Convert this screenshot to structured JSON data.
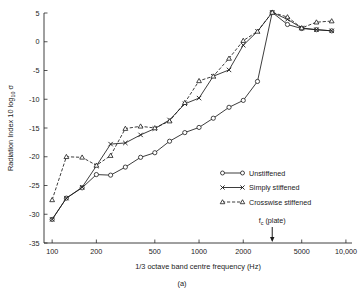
{
  "figure": {
    "caption": "(a)",
    "panel_label": "(a)"
  },
  "chart_data": {
    "type": "line",
    "title": "",
    "xlabel": "1/3 octave band centre frequency (Hz)",
    "ylabel": "Radiation Index 10 log₁₀ σ",
    "ylabel_parts": {
      "prefix": "Radiation Index 10 log",
      "subscript": "10",
      "symbol": "σ"
    },
    "xscale": "log",
    "xlim": [
      88,
      11000
    ],
    "ylim": [
      -35,
      5
    ],
    "grid": false,
    "legend_position": "lower-right",
    "xticks": [
      100,
      200,
      500,
      1000,
      2000,
      5000,
      10000
    ],
    "xticklabels": [
      "100",
      "200",
      "500",
      "1000",
      "2000",
      "5000",
      "10,000"
    ],
    "yticks": [
      5,
      0,
      -5,
      -10,
      -15,
      -20,
      -25,
      -30,
      -35
    ],
    "yticklabels": [
      "5",
      "0",
      "-5",
      "-10",
      "-15",
      "-20",
      "-25",
      "-30",
      "-35"
    ],
    "annotations": [
      {
        "name": "critical-frequency-marker",
        "label": "f",
        "label_sub": "c",
        "label_rest": " (plate)",
        "text": "fᴄ (plate)",
        "x": 3150,
        "y": -35,
        "arrow": "down"
      }
    ],
    "series": [
      {
        "name": "Unstiffened",
        "marker": "circle",
        "linestyle": "solid",
        "x": [
          100,
          125,
          160,
          200,
          250,
          315,
          400,
          500,
          630,
          800,
          1000,
          1250,
          1600,
          2000,
          2500,
          3150,
          4000,
          5000,
          6300,
          8000
        ],
        "y": [
          -30.9,
          -27.2,
          -25.4,
          -23.1,
          -23.2,
          -21.8,
          -20.1,
          -19.3,
          -17.3,
          -15.8,
          -14.9,
          -13.3,
          -11.4,
          -10.2,
          -6.9,
          5.1,
          3.0,
          2.3,
          2.1,
          1.9
        ]
      },
      {
        "name": "Simply stiffened",
        "marker": "x",
        "linestyle": "solid",
        "x": [
          100,
          125,
          160,
          200,
          250,
          315,
          400,
          500,
          630,
          800,
          1000,
          1250,
          1600,
          2000,
          2500,
          3150,
          4000,
          5000,
          6300,
          8000
        ],
        "y": [
          -30.9,
          -27.2,
          -25.3,
          -21.6,
          -17.8,
          -17.6,
          -16.2,
          -15.1,
          -13.6,
          -10.8,
          -9.8,
          -6.0,
          -4.9,
          -0.6,
          1.8,
          5.1,
          3.9,
          2.4,
          2.1,
          1.9
        ]
      },
      {
        "name": "Crosswise stiffened",
        "marker": "triangle",
        "linestyle": "dashed",
        "x": [
          100,
          125,
          160,
          200,
          250,
          315,
          400,
          500,
          630,
          800,
          1000,
          1250,
          1600,
          2000,
          2500,
          3150,
          4000,
          5000,
          6300,
          8000
        ],
        "y": [
          -27.5,
          -20.0,
          -20.1,
          -21.5,
          -19.8,
          -15.1,
          -14.7,
          -15.0,
          -13.8,
          -10.6,
          -6.8,
          -6.0,
          -2.9,
          0.2,
          1.8,
          5.1,
          4.3,
          2.4,
          3.4,
          3.6
        ]
      }
    ],
    "legend": [
      {
        "label": "Unstiffened",
        "marker": "circle",
        "linestyle": "solid"
      },
      {
        "label": "Simply stiffened",
        "marker": "x",
        "linestyle": "solid"
      },
      {
        "label": "Crosswise stiffened",
        "marker": "triangle",
        "linestyle": "dashed"
      }
    ]
  },
  "colors": {
    "ink": "#1a1a1a",
    "axis": "#2a2a2a",
    "background": "#ffffff"
  }
}
